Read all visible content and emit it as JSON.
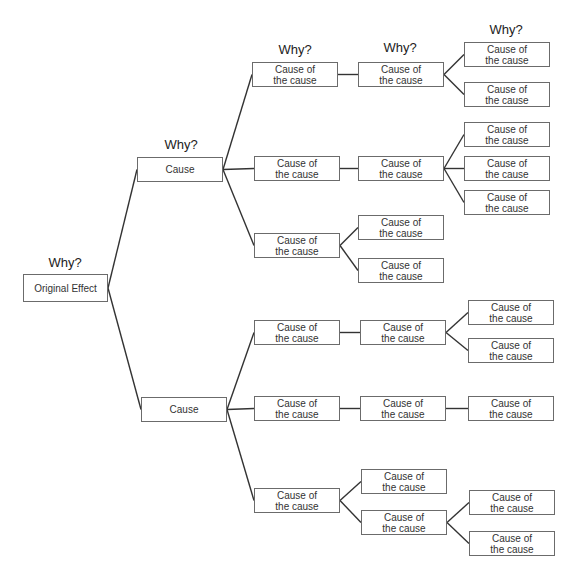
{
  "line_color": "#333333",
  "labels": {
    "why": "Why?",
    "root": "Original Effect",
    "cause": "Cause",
    "sub_cause": "Cause of\nthe cause"
  },
  "why_markers": [
    {
      "x": 65,
      "y": 255,
      "text": "Why?"
    },
    {
      "x": 181,
      "y": 137,
      "text": "Why?"
    },
    {
      "x": 295,
      "y": 42,
      "text": "Why?"
    },
    {
      "x": 400,
      "y": 40,
      "text": "Why?"
    },
    {
      "x": 506,
      "y": 22,
      "text": "Why?"
    }
  ],
  "nodes": [
    {
      "id": "root",
      "text": "Original Effect",
      "x": 23,
      "y": 274,
      "w": 85,
      "h": 28
    },
    {
      "id": "c1",
      "text": "Cause",
      "x": 137,
      "y": 157,
      "w": 86,
      "h": 25
    },
    {
      "id": "c2",
      "text": "Cause",
      "x": 141,
      "y": 397,
      "w": 86,
      "h": 25
    },
    {
      "id": "c1a",
      "text": "Cause of\nthe cause",
      "x": 252,
      "y": 62,
      "w": 86,
      "h": 25
    },
    {
      "id": "c1b",
      "text": "Cause of\nthe cause",
      "x": 254,
      "y": 156,
      "w": 86,
      "h": 25
    },
    {
      "id": "c1c",
      "text": "Cause of\nthe cause",
      "x": 254,
      "y": 233,
      "w": 86,
      "h": 25
    },
    {
      "id": "c1a1",
      "text": "Cause of\nthe cause",
      "x": 358,
      "y": 62,
      "w": 86,
      "h": 25
    },
    {
      "id": "c1b1",
      "text": "Cause of\nthe cause",
      "x": 358,
      "y": 156,
      "w": 86,
      "h": 25
    },
    {
      "id": "c1c1",
      "text": "Cause of\nthe cause",
      "x": 358,
      "y": 215,
      "w": 86,
      "h": 25
    },
    {
      "id": "c1c2",
      "text": "Cause of\nthe cause",
      "x": 358,
      "y": 258,
      "w": 86,
      "h": 25
    },
    {
      "id": "c1a1a",
      "text": "Cause of\nthe cause",
      "x": 464,
      "y": 42,
      "w": 86,
      "h": 25
    },
    {
      "id": "c1a1b",
      "text": "Cause of\nthe cause",
      "x": 464,
      "y": 82,
      "w": 86,
      "h": 25
    },
    {
      "id": "c1b1a",
      "text": "Cause of\nthe cause",
      "x": 464,
      "y": 122,
      "w": 86,
      "h": 25
    },
    {
      "id": "c1b1b",
      "text": "Cause of\nthe cause",
      "x": 464,
      "y": 156,
      "w": 86,
      "h": 25
    },
    {
      "id": "c1b1c",
      "text": "Cause of\nthe cause",
      "x": 464,
      "y": 190,
      "w": 86,
      "h": 25
    },
    {
      "id": "c2a",
      "text": "Cause of\nthe cause",
      "x": 254,
      "y": 320,
      "w": 86,
      "h": 25
    },
    {
      "id": "c2b",
      "text": "Cause of\nthe cause",
      "x": 254,
      "y": 396,
      "w": 86,
      "h": 25
    },
    {
      "id": "c2c",
      "text": "Cause of\nthe cause",
      "x": 254,
      "y": 488,
      "w": 86,
      "h": 25
    },
    {
      "id": "c2a1",
      "text": "Cause of\nthe cause",
      "x": 360,
      "y": 320,
      "w": 86,
      "h": 25
    },
    {
      "id": "c2b1",
      "text": "Cause of\nthe cause",
      "x": 360,
      "y": 396,
      "w": 86,
      "h": 25
    },
    {
      "id": "c2c1",
      "text": "Cause of\nthe cause",
      "x": 361,
      "y": 469,
      "w": 86,
      "h": 25
    },
    {
      "id": "c2c2",
      "text": "Cause of\nthe cause",
      "x": 361,
      "y": 510,
      "w": 86,
      "h": 25
    },
    {
      "id": "c2a1a",
      "text": "Cause of\nthe cause",
      "x": 468,
      "y": 300,
      "w": 86,
      "h": 25
    },
    {
      "id": "c2a1b",
      "text": "Cause of\nthe cause",
      "x": 468,
      "y": 338,
      "w": 86,
      "h": 25
    },
    {
      "id": "c2b1a",
      "text": "Cause of\nthe cause",
      "x": 468,
      "y": 396,
      "w": 86,
      "h": 25
    },
    {
      "id": "c2c2a",
      "text": "Cause of\nthe cause",
      "x": 469,
      "y": 490,
      "w": 86,
      "h": 25
    },
    {
      "id": "c2c2b",
      "text": "Cause of\nthe cause",
      "x": 469,
      "y": 531,
      "w": 86,
      "h": 25
    }
  ],
  "edges": [
    [
      "root",
      "c1"
    ],
    [
      "root",
      "c2"
    ],
    [
      "c1",
      "c1a"
    ],
    [
      "c1",
      "c1b"
    ],
    [
      "c1",
      "c1c"
    ],
    [
      "c1a",
      "c1a1"
    ],
    [
      "c1b",
      "c1b1"
    ],
    [
      "c1c",
      "c1c1"
    ],
    [
      "c1c",
      "c1c2"
    ],
    [
      "c1a1",
      "c1a1a"
    ],
    [
      "c1a1",
      "c1a1b"
    ],
    [
      "c1b1",
      "c1b1a"
    ],
    [
      "c1b1",
      "c1b1b"
    ],
    [
      "c1b1",
      "c1b1c"
    ],
    [
      "c2",
      "c2a"
    ],
    [
      "c2",
      "c2b"
    ],
    [
      "c2",
      "c2c"
    ],
    [
      "c2a",
      "c2a1"
    ],
    [
      "c2b",
      "c2b1"
    ],
    [
      "c2c",
      "c2c1"
    ],
    [
      "c2c",
      "c2c2"
    ],
    [
      "c2a1",
      "c2a1a"
    ],
    [
      "c2a1",
      "c2a1b"
    ],
    [
      "c2b1",
      "c2b1a"
    ],
    [
      "c2c2",
      "c2c2a"
    ],
    [
      "c2c2",
      "c2c2b"
    ]
  ]
}
